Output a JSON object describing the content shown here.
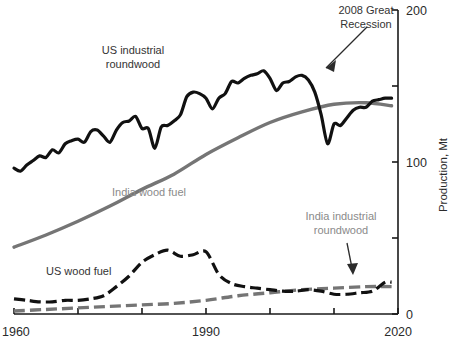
{
  "chart_data": {
    "type": "line",
    "title": "",
    "xlabel": "",
    "ylabel": "Production, Mt",
    "xlim": [
      1960,
      2020
    ],
    "ylim": [
      0,
      200
    ],
    "grid": false,
    "legend_position": "inline-labels",
    "x_ticks": [
      1960,
      1970,
      1980,
      1990,
      2000,
      2010,
      2020
    ],
    "x_tick_labels": [
      "1960",
      "",
      "",
      "1990",
      "",
      "",
      "2020"
    ],
    "y_ticks": [
      0,
      50,
      100,
      150,
      200
    ],
    "y_tick_labels": [
      "0",
      "",
      "100",
      "",
      "200"
    ],
    "axis_side": "right",
    "series": [
      {
        "name": "US industrial roundwood",
        "style": "solid",
        "color": "#111111",
        "label_color": "#333333",
        "x": [
          1960,
          1961,
          1962,
          1963,
          1964,
          1965,
          1966,
          1967,
          1968,
          1969,
          1970,
          1971,
          1972,
          1973,
          1974,
          1975,
          1976,
          1977,
          1978,
          1979,
          1980,
          1981,
          1982,
          1983,
          1984,
          1985,
          1986,
          1987,
          1988,
          1989,
          1990,
          1991,
          1992,
          1993,
          1994,
          1995,
          1996,
          1997,
          1998,
          1999,
          2000,
          2001,
          2002,
          2003,
          2004,
          2005,
          2006,
          2007,
          2008,
          2009,
          2010,
          2011,
          2012,
          2013,
          2014,
          2015,
          2016,
          2017,
          2018,
          2019
        ],
        "y": [
          96,
          94,
          98,
          101,
          104,
          103,
          108,
          106,
          112,
          114,
          115,
          113,
          120,
          121,
          117,
          113,
          121,
          126,
          127,
          130,
          122,
          122,
          109,
          123,
          124,
          127,
          131,
          143,
          146,
          145,
          142,
          135,
          142,
          145,
          153,
          152,
          155,
          157,
          158,
          160,
          155,
          147,
          152,
          153,
          156,
          157,
          154,
          146,
          131,
          112,
          125,
          124,
          129,
          134,
          136,
          136,
          140,
          141,
          142,
          142
        ]
      },
      {
        "name": "India wood fuel",
        "style": "solid",
        "color": "#757575",
        "label_color": "#8a8a8a",
        "x": [
          1960,
          1965,
          1970,
          1975,
          1980,
          1985,
          1990,
          1995,
          2000,
          2005,
          2010,
          2015,
          2019
        ],
        "y": [
          44,
          52,
          61,
          71,
          82,
          92,
          105,
          116,
          126,
          133,
          138,
          139,
          137
        ]
      },
      {
        "name": "US wood fuel",
        "style": "dashed",
        "color": "#111111",
        "label_color": "#333333",
        "x": [
          1960,
          1962,
          1964,
          1966,
          1968,
          1970,
          1972,
          1974,
          1976,
          1978,
          1980,
          1982,
          1984,
          1986,
          1988,
          1990,
          1992,
          1994,
          1996,
          1998,
          2000,
          2002,
          2004,
          2006,
          2008,
          2010,
          2012,
          2014,
          2016,
          2018,
          2019
        ],
        "y": [
          10,
          9,
          8,
          8,
          9,
          9,
          10,
          12,
          18,
          25,
          34,
          39,
          42,
          38,
          39,
          41,
          26,
          20,
          18,
          17,
          16,
          15,
          15,
          16,
          15,
          13,
          13,
          14,
          15,
          21,
          21
        ]
      },
      {
        "name": "India industrial roundwood",
        "style": "dashed",
        "color": "#757575",
        "label_color": "#8a8a8a",
        "x": [
          1960,
          1965,
          1970,
          1975,
          1980,
          1985,
          1990,
          1995,
          2000,
          2005,
          2010,
          2015,
          2019
        ],
        "y": [
          2,
          3,
          4,
          5,
          6,
          7,
          9,
          12,
          14,
          16,
          17,
          18,
          18
        ]
      }
    ],
    "annotations": [
      {
        "text": "2008 Great Recession",
        "lines": [
          "2008 Great",
          "Recession"
        ],
        "points_to_year": 2008,
        "points_to_value": 131,
        "color": "#2b2b2b"
      },
      {
        "text": "India industrial roundwood",
        "lines": [
          "India industrial",
          "roundwood"
        ],
        "points_to_year": 2012,
        "points_to_value": 18,
        "color": "#8a8a8a"
      }
    ],
    "inline_labels": [
      {
        "text_lines": [
          "US industrial",
          "roundwood"
        ],
        "color": "#333333"
      },
      {
        "text_lines": [
          "India wood fuel"
        ],
        "color": "#8a8a8a"
      },
      {
        "text_lines": [
          "US wood fuel"
        ],
        "color": "#333333"
      }
    ]
  },
  "axis": {
    "y_label": "Production, Mt",
    "y_tick_0": "0",
    "y_tick_100": "100",
    "y_tick_200": "200",
    "x_tick_1960": "1960",
    "x_tick_1990": "1990",
    "x_tick_2020": "2020"
  },
  "labels": {
    "us_industrial_roundwood_l1": "US industrial",
    "us_industrial_roundwood_l2": "roundwood",
    "india_wood_fuel": "India wood fuel",
    "us_wood_fuel": "US wood fuel",
    "india_industrial_roundwood_l1": "India industrial",
    "india_industrial_roundwood_l2": "roundwood",
    "recession_l1": "2008 Great",
    "recession_l2": "Recession"
  },
  "colors": {
    "dark_series": "#111111",
    "gray_series": "#757575",
    "axis": "#1a1a1a",
    "background": "#ffffff"
  }
}
